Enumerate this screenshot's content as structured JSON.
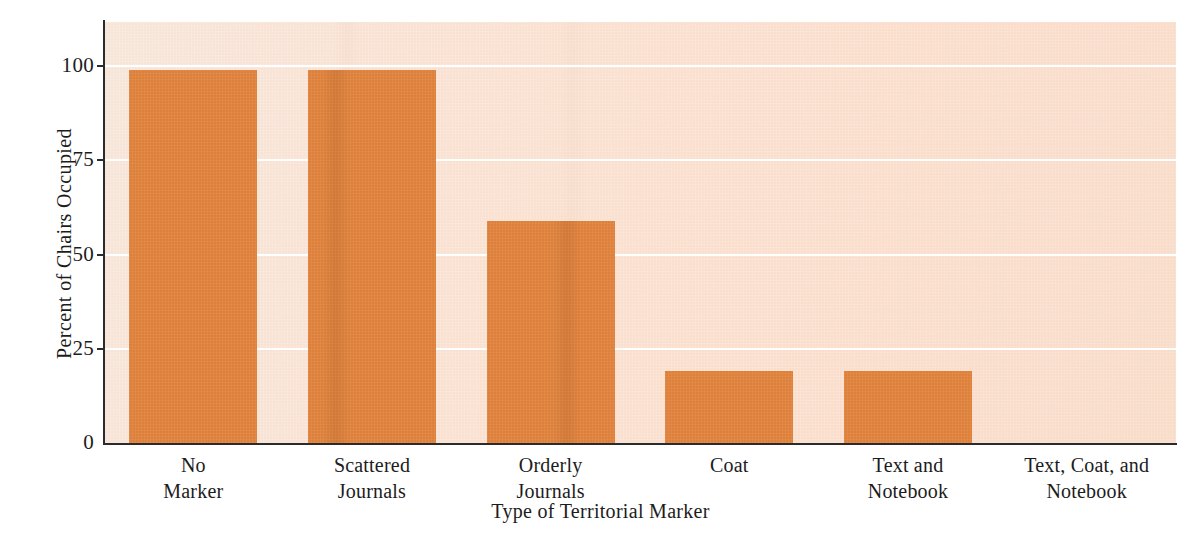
{
  "chart_data": {
    "type": "bar",
    "title": "",
    "xlabel": "Type of Territorial Marker",
    "ylabel": "Percent of Chairs Occupied",
    "categories": [
      "No Marker",
      "Scattered Journals",
      "Orderly Journals",
      "Coat",
      "Text and Notebook",
      "Text, Coat, and Notebook"
    ],
    "category_lines": [
      [
        "No",
        "Marker"
      ],
      [
        "Scattered",
        "Journals"
      ],
      [
        "Orderly",
        "Journals"
      ],
      [
        "Coat"
      ],
      [
        "Text and",
        "Notebook"
      ],
      [
        "Text, Coat, and",
        "Notebook"
      ]
    ],
    "values": [
      99,
      99,
      59,
      19,
      19,
      0
    ],
    "ylim": [
      0,
      100
    ],
    "yticks": [
      0,
      25,
      50,
      75,
      100
    ],
    "ytick_labels": [
      "0",
      "25",
      "50",
      "75",
      "100"
    ],
    "grid": true,
    "gridlines_at": [
      25,
      50,
      75,
      100
    ],
    "legend": null,
    "legend_position": "none",
    "bar_color": "#e2853f",
    "plot_background_color": "#fae6da",
    "gridline_color": "#ffffff",
    "axis_color": "#2b2b2b",
    "figure_background_color": "#ffffff"
  },
  "axes": {
    "y_title": "Percent of Chairs Occupied",
    "x_title": "Type of Territorial Marker"
  }
}
